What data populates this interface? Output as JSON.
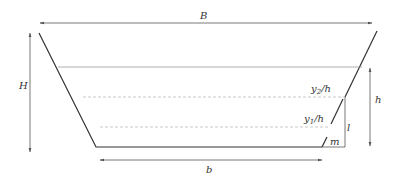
{
  "diagram": {
    "labels": {
      "top_width": "B",
      "total_height": "H",
      "water_depth": "h",
      "bottom_width": "b",
      "y2_level": {
        "base": "y",
        "sub": "2",
        "rest": "/h"
      },
      "y1_level": {
        "base": "y",
        "sub": "1",
        "rest": "/h"
      },
      "vertical_leg": "l",
      "horizontal_leg": "m"
    },
    "colors": {
      "outline": "#333333",
      "dimension": "#555555",
      "water_line": "#999999",
      "dashed": "#bbbbbb"
    }
  }
}
